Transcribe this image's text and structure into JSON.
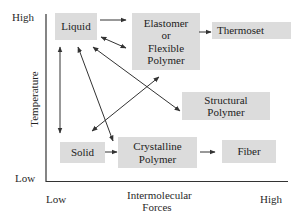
{
  "axes": {
    "y_label": "Temperature",
    "y_high": "High",
    "y_low": "Low",
    "x_label_line1": "Intermolecular",
    "x_label_line2": "Forces",
    "x_low": "Low",
    "x_high": "High"
  },
  "nodes": {
    "liquid": "Liquid",
    "elastomer_line1": "Elastomer",
    "elastomer_line2": "or",
    "elastomer_line3": "Flexible",
    "elastomer_line4": "Polymer",
    "thermoset": "Thermoset",
    "structural_line1": "Structural",
    "structural_line2": "Polymer",
    "solid": "Solid",
    "crystalline_line1": "Crystalline",
    "crystalline_line2": "Polymer",
    "fiber": "Fiber"
  },
  "edges": [
    {
      "from": "Liquid",
      "to": "Elastomer or Flexible Polymer",
      "type": "one-way"
    },
    {
      "from": "Liquid",
      "to": "Elastomer or Flexible Polymer",
      "type": "two-way"
    },
    {
      "from": "Elastomer or Flexible Polymer",
      "to": "Thermoset",
      "type": "one-way"
    },
    {
      "from": "Liquid",
      "to": "Solid",
      "type": "two-way"
    },
    {
      "from": "Liquid",
      "to": "Crystalline Polymer",
      "type": "two-way"
    },
    {
      "from": "Liquid",
      "to": "Structural Polymer",
      "type": "two-way"
    },
    {
      "from": "Solid",
      "to": "Elastomer or Flexible Polymer",
      "type": "two-way"
    },
    {
      "from": "Solid",
      "to": "Crystalline Polymer",
      "type": "one-way"
    },
    {
      "from": "Crystalline Polymer",
      "to": "Fiber",
      "type": "one-way"
    }
  ],
  "colors": {
    "box_fill": "#dcdcdc",
    "line": "#333333"
  }
}
